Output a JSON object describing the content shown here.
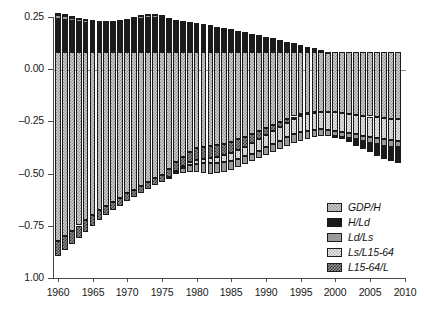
{
  "chart_data": {
    "type": "bar",
    "subtype": "stacked-bar",
    "title": "",
    "subtitle": "",
    "xlabel": "",
    "ylabel": "",
    "xlim": [
      1959.3,
      2010.2
    ],
    "ylim": [
      -1.0,
      0.25
    ],
    "grid": false,
    "orientation": "vertical",
    "stacked": true,
    "baseline": 0.0,
    "legend_position": "bottom-right",
    "y_ticks": [
      0.25,
      0.0,
      -0.25,
      -0.5,
      -0.75,
      -1.0
    ],
    "y_tick_labels": [
      "0.25",
      "0.00",
      "–0.25",
      "–0.50",
      "–0.75",
      "1.00"
    ],
    "x_ticks": [
      1960,
      1965,
      1970,
      1975,
      1980,
      1985,
      1990,
      1995,
      2000,
      2005,
      2010
    ],
    "x_tick_labels": [
      "1960",
      "1965",
      "1970",
      "1975",
      "1980",
      "1985",
      "1990",
      "1995",
      "2000",
      "2005",
      "2010"
    ],
    "x": [
      1960,
      1961,
      1962,
      1963,
      1964,
      1965,
      1966,
      1967,
      1968,
      1969,
      1970,
      1971,
      1972,
      1973,
      1974,
      1975,
      1976,
      1977,
      1978,
      1979,
      1980,
      1981,
      1982,
      1983,
      1984,
      1985,
      1986,
      1987,
      1988,
      1989,
      1990,
      1991,
      1992,
      1993,
      1994,
      1995,
      1996,
      1997,
      1998,
      1999,
      2000,
      2001,
      2002,
      2003,
      2004,
      2005,
      2006,
      2007,
      2008,
      2009
    ],
    "legend_entries": [
      "GDP/H",
      "H/Ld",
      "Ld/Ls",
      "Ls/L15-64",
      "L15-64/L"
    ],
    "series": [
      {
        "name": "GDP/H",
        "fill": "light-checker",
        "color": "#cfcfcf",
        "values": [
          -0.905,
          -0.88,
          -0.855,
          -0.83,
          -0.805,
          -0.78,
          -0.758,
          -0.737,
          -0.716,
          -0.696,
          -0.676,
          -0.658,
          -0.64,
          -0.622,
          -0.604,
          -0.586,
          -0.56,
          -0.528,
          -0.5,
          -0.476,
          -0.46,
          -0.452,
          -0.448,
          -0.444,
          -0.438,
          -0.43,
          -0.418,
          -0.404,
          -0.39,
          -0.376,
          -0.362,
          -0.348,
          -0.334,
          -0.32,
          -0.308,
          -0.298,
          -0.292,
          -0.288,
          -0.286,
          -0.286,
          -0.288,
          -0.292,
          -0.296,
          -0.3,
          -0.304,
          -0.308,
          -0.312,
          -0.316,
          -0.318,
          -0.32
        ]
      },
      {
        "name": "H/Ld",
        "fill": "solid-black",
        "color": "#1a1a1a",
        "values": [
          0.16,
          0.155,
          0.15,
          0.146,
          0.142,
          0.138,
          0.136,
          0.136,
          0.137,
          0.14,
          0.145,
          0.152,
          0.158,
          0.162,
          0.163,
          0.163,
          0.16,
          0.155,
          0.15,
          0.145,
          0.14,
          0.134,
          0.128,
          0.122,
          0.116,
          0.11,
          0.103,
          0.096,
          0.089,
          0.082,
          0.074,
          0.066,
          0.058,
          0.05,
          0.042,
          0.034,
          0.026,
          0.018,
          0.01,
          0.002,
          -0.006,
          -0.014,
          -0.022,
          -0.03,
          -0.038,
          -0.046,
          -0.054,
          -0.062,
          -0.07,
          -0.078
        ]
      },
      {
        "name": "Ld/Ls",
        "fill": "solid-gray",
        "color": "#9a9a9a",
        "values": [
          0.018,
          0.016,
          0.014,
          0.012,
          0.01,
          0.009,
          0.008,
          0.008,
          0.008,
          0.009,
          0.01,
          0.012,
          0.014,
          0.016,
          0.014,
          0.012,
          0.006,
          -0.01,
          -0.022,
          -0.03,
          -0.04,
          -0.048,
          -0.052,
          -0.05,
          -0.046,
          -0.042,
          -0.04,
          -0.038,
          -0.036,
          -0.034,
          -0.034,
          -0.036,
          -0.038,
          -0.04,
          -0.042,
          -0.042,
          -0.04,
          -0.036,
          -0.032,
          -0.028,
          -0.024,
          -0.022,
          -0.022,
          -0.024,
          -0.026,
          -0.028,
          -0.03,
          -0.03,
          -0.03,
          -0.028
        ]
      },
      {
        "name": "Ls/L15-64",
        "fill": "very-light-checker",
        "color": "#e6e6e6",
        "values": [
          0.012,
          0.01,
          0.009,
          0.008,
          0.007,
          0.006,
          0.005,
          0.005,
          0.005,
          0.005,
          0.005,
          0.005,
          0.005,
          0.005,
          0.004,
          0.003,
          -0.002,
          -0.006,
          -0.01,
          -0.014,
          -0.018,
          -0.022,
          -0.026,
          -0.03,
          -0.034,
          -0.038,
          -0.042,
          -0.046,
          -0.05,
          -0.054,
          -0.058,
          -0.062,
          -0.066,
          -0.07,
          -0.074,
          -0.078,
          -0.08,
          -0.082,
          -0.084,
          -0.086,
          -0.088,
          -0.09,
          -0.092,
          -0.094,
          -0.096,
          -0.098,
          -0.1,
          -0.102,
          -0.104,
          -0.106
        ]
      },
      {
        "name": "L15-64/L",
        "fill": "dark-checker",
        "color": "#8c8c8c",
        "values": [
          -0.07,
          -0.066,
          -0.062,
          -0.058,
          -0.054,
          -0.05,
          -0.047,
          -0.044,
          -0.041,
          -0.039,
          -0.037,
          -0.035,
          -0.034,
          -0.033,
          -0.033,
          -0.034,
          -0.036,
          -0.04,
          -0.046,
          -0.052,
          -0.056,
          -0.058,
          -0.058,
          -0.056,
          -0.054,
          -0.052,
          -0.05,
          -0.048,
          -0.046,
          -0.042,
          -0.036,
          -0.03,
          -0.024,
          -0.018,
          -0.012,
          -0.008,
          -0.004,
          -0.002,
          0.0,
          0.0,
          0.0,
          0.0,
          0.0,
          0.0,
          0.0,
          0.0,
          0.0,
          0.0,
          0.0,
          0.0
        ]
      }
    ]
  }
}
